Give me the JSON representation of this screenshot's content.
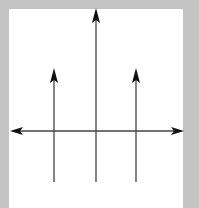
{
  "diagram": {
    "background_color": "#c4c4c4",
    "panel_color": "#ffffff",
    "line_color": "#333333",
    "horizontal_axis": {
      "y": 131,
      "x_start": 10,
      "x_end": 184,
      "double_headed": true
    },
    "vertical_arrows": [
      {
        "name": "left",
        "x": 54,
        "top": 68,
        "bottom": 182
      },
      {
        "name": "center",
        "x": 96,
        "top": 8,
        "bottom": 182
      },
      {
        "name": "right",
        "x": 136,
        "top": 68,
        "bottom": 182
      }
    ]
  }
}
